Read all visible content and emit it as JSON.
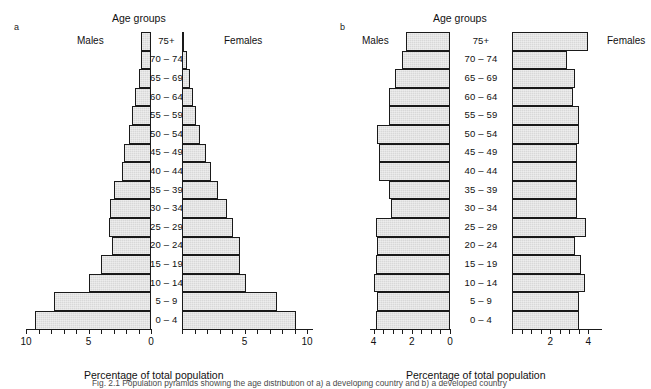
{
  "figure": {
    "caption_prefix": "Fig. 2.1",
    "caption_text": "Fig. 2.1   Population pyramids showing the age distribution of a) a developing country and b) a developed country"
  },
  "panels": [
    {
      "letter": "a",
      "age_title": "Age groups",
      "left_label": "Males",
      "right_label": "Females",
      "axis_caption": "Percentage of total population",
      "tick_labels_left": [
        "10",
        "5",
        "0"
      ],
      "tick_labels_right": [
        "5",
        "10"
      ],
      "age_groups": [
        "75+",
        "70 – 74",
        "65 – 69",
        "60 – 64",
        "55 – 59",
        "50 – 54",
        "45 – 49",
        "40 – 44",
        "35 – 39",
        "30 – 34",
        "25 – 29",
        "20 – 24",
        "15 – 19",
        "10 – 14",
        "5 – 9",
        "0 – 4"
      ]
    },
    {
      "letter": "b",
      "age_title": "Age groups",
      "left_label": "Males",
      "right_label": "Females",
      "axis_caption": "Percentage of total population",
      "tick_labels_left": [
        "4",
        "2",
        "0"
      ],
      "tick_labels_right": [
        "2",
        "4"
      ],
      "age_groups": [
        "75+",
        "70 – 74",
        "65 – 69",
        "60 – 64",
        "55 – 59",
        "50 – 54",
        "45 – 49",
        "40 – 44",
        "35 – 39",
        "30 – 34",
        "25 – 29",
        "20 – 24",
        "15 – 19",
        "10 – 14",
        "5 – 9",
        "0 – 4"
      ]
    }
  ],
  "chart_data": [
    {
      "type": "bar",
      "title": "a",
      "subtitle": "Age groups",
      "xlabel": "Percentage of total population",
      "ylabel": "Age groups",
      "orientation": "horizontal-diverging",
      "categories": [
        "75+",
        "70 – 74",
        "65 – 69",
        "60 – 64",
        "55 – 59",
        "50 – 54",
        "45 – 49",
        "40 – 44",
        "35 – 39",
        "30 – 34",
        "25 – 29",
        "20 – 24",
        "15 – 19",
        "10 – 14",
        "5 – 9",
        "0 – 4"
      ],
      "series": [
        {
          "name": "Males",
          "values": [
            0.8,
            0.8,
            1.0,
            1.3,
            1.5,
            1.8,
            2.2,
            2.3,
            3.0,
            3.3,
            3.4,
            3.1,
            4.0,
            5.0,
            7.8,
            9.3
          ]
        },
        {
          "name": "Females",
          "values": [
            0.1,
            0.4,
            0.6,
            0.9,
            1.1,
            1.4,
            1.9,
            2.3,
            2.9,
            3.6,
            4.1,
            4.6,
            4.6,
            5.1,
            7.6,
            9.1
          ]
        }
      ],
      "xlim_left": [
        10,
        0
      ],
      "xlim_right": [
        0,
        10
      ],
      "xticks_left": [
        10,
        9,
        8,
        7,
        6,
        5,
        4,
        3,
        2,
        1,
        0
      ],
      "xticks_right": [
        0,
        1,
        2,
        3,
        4,
        5,
        6,
        7,
        8,
        9,
        10
      ],
      "xtick_labels_left": [
        "10",
        "5",
        "0"
      ],
      "xtick_labels_right": [
        "5",
        "10"
      ],
      "grid": false,
      "legend": "inline-side-labels"
    },
    {
      "type": "bar",
      "title": "b",
      "subtitle": "Age groups",
      "xlabel": "Percentage of total population",
      "ylabel": "Age groups",
      "orientation": "horizontal-diverging",
      "categories": [
        "75+",
        "70 – 74",
        "65 – 69",
        "60 – 64",
        "55 – 59",
        "50 – 54",
        "45 – 49",
        "40 – 44",
        "35 – 39",
        "30 – 34",
        "25 – 29",
        "20 – 24",
        "15 – 19",
        "10 – 14",
        "5 – 9",
        "0 – 4"
      ],
      "series": [
        {
          "name": "Males",
          "values": [
            2.3,
            2.5,
            2.9,
            3.2,
            3.2,
            3.8,
            3.7,
            3.7,
            3.2,
            3.1,
            3.9,
            3.8,
            3.9,
            4.0,
            3.8,
            3.9
          ]
        },
        {
          "name": "Females",
          "values": [
            4.0,
            2.9,
            3.3,
            3.2,
            3.5,
            3.5,
            3.4,
            3.4,
            3.4,
            3.4,
            3.9,
            3.3,
            3.6,
            3.8,
            3.5,
            3.5
          ]
        }
      ],
      "xlim_left": [
        4,
        0
      ],
      "xlim_right": [
        0,
        4
      ],
      "xticks_left": [
        4,
        3.5,
        3,
        2.5,
        2,
        1.5,
        1,
        0.5,
        0
      ],
      "xticks_right": [
        0,
        0.5,
        1,
        1.5,
        2,
        2.5,
        3,
        3.5,
        4
      ],
      "xtick_labels_left": [
        "4",
        "2",
        "0"
      ],
      "xtick_labels_right": [
        "2",
        "4"
      ],
      "grid": false,
      "legend": "inline-side-labels"
    }
  ],
  "colors": {
    "bar_fill": "#d8d8d8",
    "bar_stroke": "#1a1a1a",
    "text": "#111111",
    "background": "#ffffff"
  }
}
